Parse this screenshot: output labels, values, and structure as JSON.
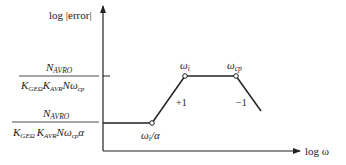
{
  "diagram": {
    "type": "bode-asymptotic-magnitude-plot",
    "y_axis_label": "log |error|",
    "x_axis_label": "log ω",
    "levels": {
      "upper": {
        "numerator": {
          "base": "N",
          "sub": "AVRO"
        },
        "denominator": [
          {
            "base": "K",
            "sub": "GEΩ"
          },
          {
            "base": "K",
            "sub": "AVR"
          },
          {
            "base": "Nω",
            "sub": "cp"
          }
        ]
      },
      "lower": {
        "numerator": {
          "base": "N",
          "sub": "AVRO"
        },
        "denominator": [
          {
            "base": "K",
            "sub": "GEΩ"
          },
          {
            "base": "K",
            "sub": "AVR"
          },
          {
            "base": "Nω",
            "sub": "cp"
          },
          {
            "base": "α",
            "sub": ""
          }
        ]
      }
    },
    "breakpoints": [
      {
        "id": "wi_over_alpha",
        "label_base": "ω",
        "label_sub": "i",
        "label_suffix": "/α"
      },
      {
        "id": "wi",
        "label_base": "ω",
        "label_sub": "i",
        "label_suffix": ""
      },
      {
        "id": "wcp",
        "label_base": "ω",
        "label_sub": "cp",
        "label_suffix": ""
      }
    ],
    "slopes": [
      {
        "label": "+1"
      },
      {
        "label": "−1"
      }
    ]
  }
}
